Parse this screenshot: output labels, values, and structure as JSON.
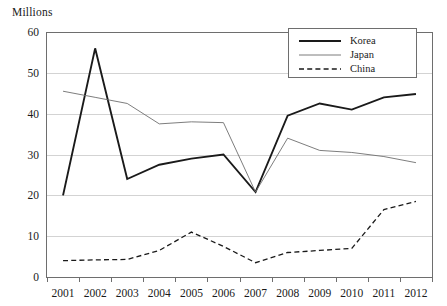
{
  "axis_unit_label": "Millions",
  "chart_data": {
    "type": "line",
    "title": "",
    "subtitle": "",
    "xlabel": "",
    "ylabel": "Millions",
    "categories": [
      "2001",
      "2002",
      "2003",
      "2004",
      "2005",
      "2006",
      "2007",
      "2008",
      "2009",
      "2010",
      "2011",
      "2012"
    ],
    "x": [
      2001,
      2002,
      2003,
      2004,
      2005,
      2006,
      2007,
      2008,
      2009,
      2010,
      2011,
      2012
    ],
    "ylim": [
      0,
      60
    ],
    "ytick_labels": [
      "0",
      "10",
      "20",
      "30",
      "40",
      "50",
      "60"
    ],
    "yticks": [
      0,
      10,
      20,
      30,
      40,
      50,
      60
    ],
    "grid": "horizontal",
    "legend_position": "top-right",
    "series": [
      {
        "name": "Korea",
        "style": "solid-thick",
        "color": "#1a1a1a",
        "width": 1.9,
        "values": [
          20.0,
          56.0,
          24.0,
          27.5,
          29.0,
          30.0,
          20.8,
          39.5,
          42.5,
          41.0,
          44.0,
          44.8
        ]
      },
      {
        "name": "Japan",
        "style": "solid-thin",
        "color": "#6e6e6e",
        "width": 0.9,
        "values": [
          45.5,
          44.0,
          42.5,
          37.5,
          38.0,
          37.8,
          20.8,
          34.0,
          31.0,
          30.5,
          29.5,
          28.0
        ]
      },
      {
        "name": "China",
        "style": "dashed",
        "color": "#1a1a1a",
        "width": 1.3,
        "values": [
          4.0,
          4.2,
          4.3,
          6.5,
          11.0,
          7.5,
          3.5,
          6.0,
          6.5,
          7.0,
          16.5,
          18.5
        ]
      }
    ]
  }
}
